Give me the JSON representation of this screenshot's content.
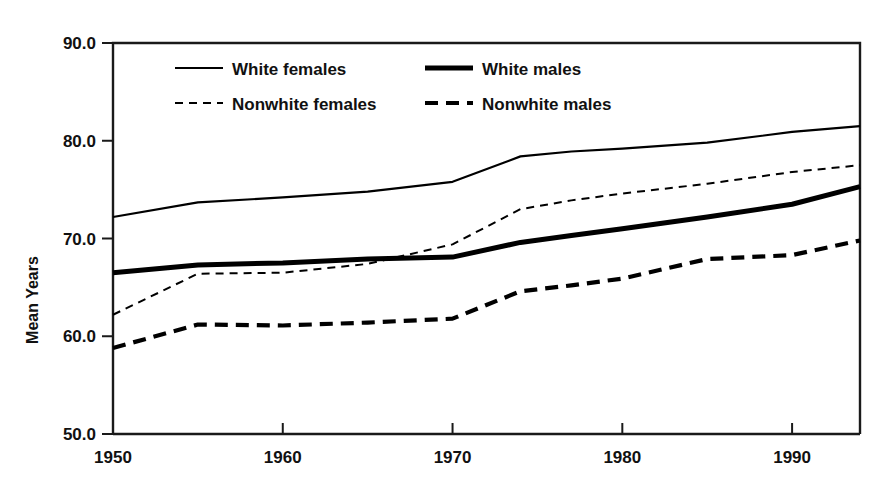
{
  "chart_data": {
    "type": "line",
    "title": "",
    "subtitle": "",
    "xlabel": "",
    "ylabel": "Mean Years",
    "xlim": [
      1950,
      1994
    ],
    "ylim": [
      50.0,
      90.0
    ],
    "grid": false,
    "legend_position": "top-left-inside",
    "x_ticks": [
      1950,
      1960,
      1970,
      1980,
      1990
    ],
    "x_tick_labels": [
      "1950",
      "1960",
      "1970",
      "1980",
      "1990"
    ],
    "y_ticks": [
      50.0,
      60.0,
      70.0,
      80.0,
      90.0
    ],
    "y_tick_labels": [
      "50.0",
      "60.0",
      "70.0",
      "80.0",
      "90.0"
    ],
    "x": [
      1950,
      1955,
      1960,
      1965,
      1970,
      1974,
      1977,
      1980,
      1985,
      1990,
      1994
    ],
    "series": [
      {
        "name": "White females",
        "style": "solid-thin",
        "color": "#000000",
        "width": 2.2,
        "dash": "none",
        "values": [
          72.2,
          73.7,
          74.2,
          74.8,
          75.8,
          78.4,
          78.9,
          79.2,
          79.8,
          80.9,
          81.5
        ]
      },
      {
        "name": "White males",
        "style": "solid-thick",
        "color": "#000000",
        "width": 5.0,
        "dash": "none",
        "values": [
          66.5,
          67.3,
          67.5,
          67.9,
          68.1,
          69.6,
          70.3,
          71.0,
          72.2,
          73.5,
          75.3
        ]
      },
      {
        "name": "Nonwhite females",
        "style": "dashed-thin",
        "color": "#000000",
        "width": 2.0,
        "dash": "8,6",
        "values": [
          62.2,
          66.4,
          66.5,
          67.4,
          69.4,
          73.0,
          73.9,
          74.6,
          75.6,
          76.8,
          77.5
        ]
      },
      {
        "name": "Nonwhite males",
        "style": "dashed-thick",
        "color": "#000000",
        "width": 4.2,
        "dash": "13,8",
        "values": [
          58.8,
          61.2,
          61.1,
          61.4,
          61.8,
          64.6,
          65.2,
          65.9,
          67.9,
          68.3,
          69.8
        ]
      }
    ],
    "legend": [
      {
        "label": "White females",
        "style": "solid-thin"
      },
      {
        "label": "White males",
        "style": "solid-thick"
      },
      {
        "label": "Nonwhite females",
        "style": "dashed-thin"
      },
      {
        "label": "Nonwhite males",
        "style": "dashed-thick"
      }
    ]
  }
}
